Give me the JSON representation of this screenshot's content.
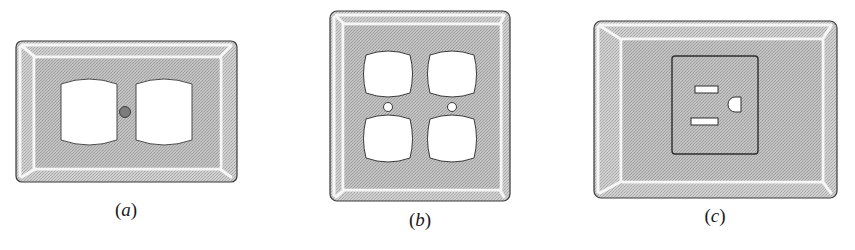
{
  "figure": {
    "colors": {
      "plate_fill": "#c9c9c9",
      "plate_dot": "#b4b4b4",
      "outline": "#3a3a3a",
      "bevel_highlight": "#f4f4f4",
      "opening_fill": "#ffffff",
      "screw_fill_a": "#7a7a7a",
      "screw_fill_b": "#ffffff",
      "outlet_box_fill": "#bdbdbd"
    },
    "panels": [
      {
        "id": "a",
        "caption_open": "(",
        "caption_letter": "a",
        "caption_close": ")",
        "description": "Duplex receptacle cover plate",
        "openings": 2,
        "screws": 1
      },
      {
        "id": "b",
        "caption_open": "(",
        "caption_letter": "b",
        "caption_close": ")",
        "description": "Double duplex receptacle cover plate",
        "openings": 4,
        "screws": 2
      },
      {
        "id": "c",
        "caption_open": "(",
        "caption_letter": "c",
        "caption_close": ")",
        "description": "Single grounded receptacle plate",
        "openings": 1,
        "screws": 0
      }
    ]
  }
}
